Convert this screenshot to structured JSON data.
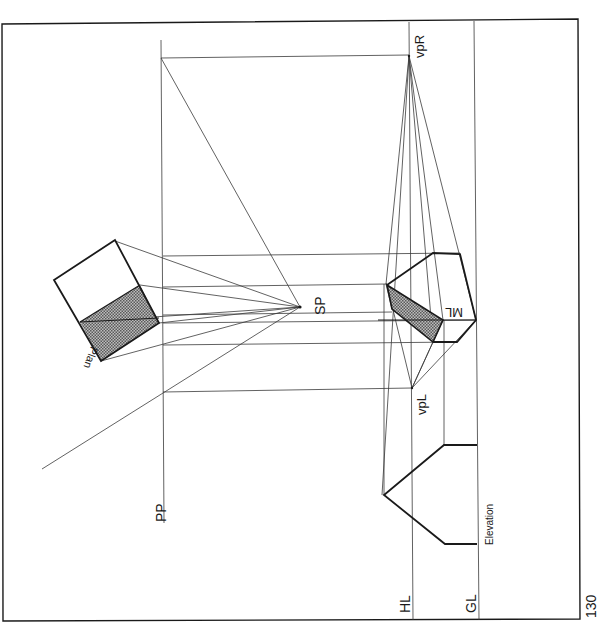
{
  "page": {
    "page_number": "130",
    "ink_color": "#1a1a1a",
    "thin_line_color": "#3a3a3a",
    "hatch_color": "#555555"
  },
  "labels": {
    "picture_plane": "PP",
    "station_point": "SP",
    "horizon_line": "HL",
    "ground_line": "GL",
    "vanishing_point_right": "vpR",
    "vanishing_point_left": "vpL",
    "measuring_line": "ML",
    "plan": "Plan",
    "elevation": "Elevation"
  },
  "geometry": {
    "frame": {
      "x1": 2,
      "y1": 22,
      "x2": 580,
      "y2": 619
    },
    "pp_x": 163,
    "hl_x": 410,
    "gl_x": 477,
    "sp": [
      300,
      307
    ],
    "vpR": [
      409,
      56
    ],
    "vpL": [
      412,
      388
    ],
    "projection_rows_y": [
      256,
      287,
      315,
      323,
      345,
      392
    ],
    "plan_cube": {
      "top": [
        115,
        240
      ],
      "left": [
        54,
        280
      ],
      "bottom": [
        101,
        361
      ],
      "right": [
        159,
        323
      ],
      "mid_left": [
        80,
        322
      ],
      "mid_right": [
        140,
        285
      ]
    }
  }
}
